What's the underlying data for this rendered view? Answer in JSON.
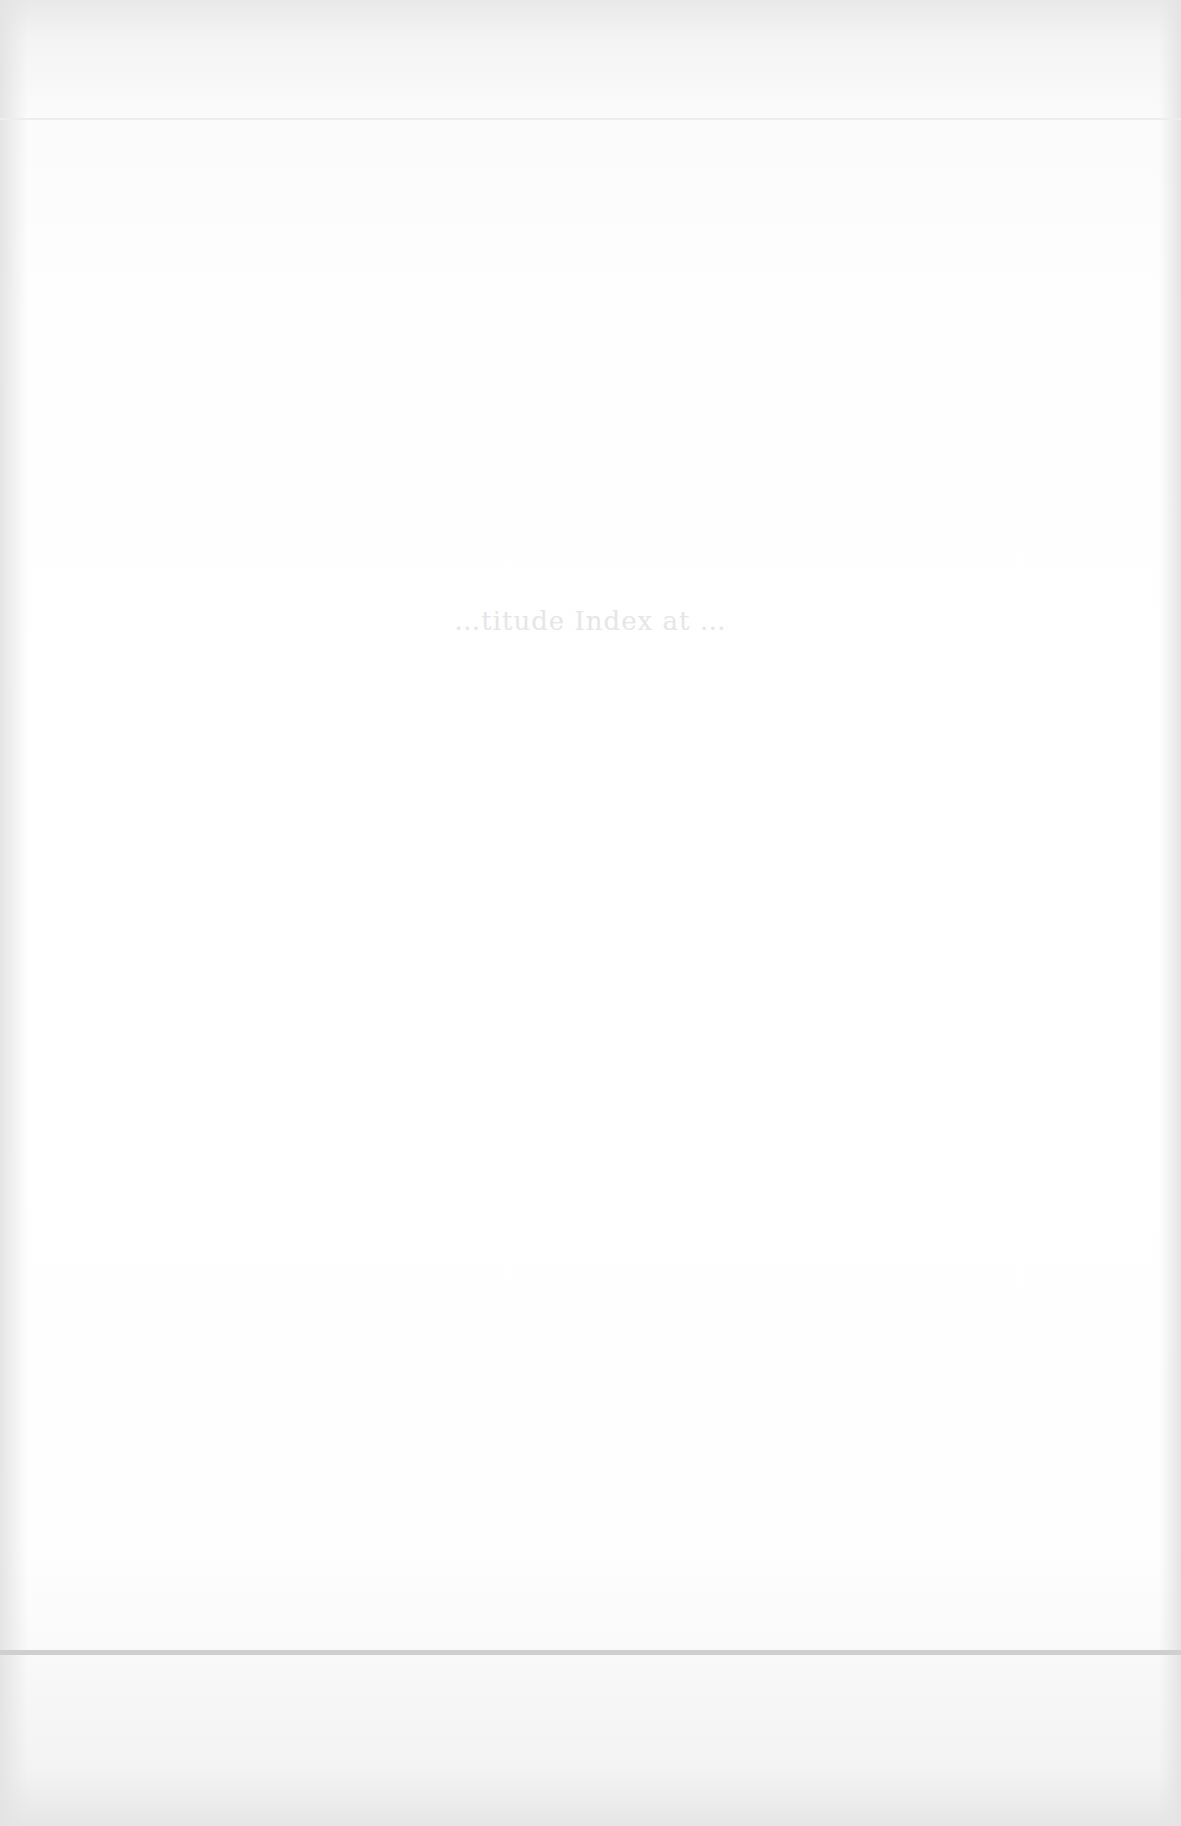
{
  "document": {
    "heading": "…titude Index at …",
    "heading_legibility": "faded, mostly illegible"
  },
  "colors": {
    "paper": "#fdfdfd",
    "rule": "#cfcfcf",
    "faded_text": "#e6e6e6"
  }
}
